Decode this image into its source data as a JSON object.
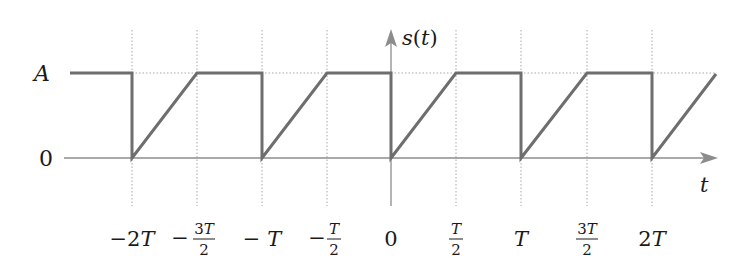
{
  "figure": {
    "y_axis_label": "s(t)",
    "x_axis_label": "t",
    "y_ticks": [
      {
        "label": "A",
        "value": "A"
      },
      {
        "label": "0",
        "value": "0"
      }
    ],
    "x_ticks": [
      {
        "label": "−2T",
        "kind": "plain",
        "value": -2.0
      },
      {
        "label": "−3T/2",
        "kind": "frac",
        "sign": "−",
        "num": "3T",
        "den": "2",
        "value": -1.5
      },
      {
        "label": "−T",
        "kind": "plain",
        "value": -1.0
      },
      {
        "label": "−T/2",
        "kind": "frac",
        "sign": "−",
        "num": "T",
        "den": "2",
        "value": -0.5
      },
      {
        "label": "0",
        "kind": "plain",
        "value": 0.0
      },
      {
        "label": "T/2",
        "kind": "frac",
        "sign": "",
        "num": "T",
        "den": "2",
        "value": 0.5
      },
      {
        "label": "T",
        "kind": "plain",
        "value": 1.0
      },
      {
        "label": "3T/2",
        "kind": "frac",
        "sign": "",
        "num": "3T",
        "den": "2",
        "value": 1.5
      },
      {
        "label": "2T",
        "kind": "plain",
        "value": 2.0
      }
    ],
    "colors": {
      "signal": "#6e6e6e",
      "axis": "#8c8c8c",
      "grid_dotted": "#a8a8a8",
      "text": "#1a1a1a"
    },
    "signal_description": "Periodic with period T: at t = kT the signal drops from A to 0, then rises linearly to A at t = kT + T/2, and holds A until t = (k+1)T.",
    "signal_points_t_over_T": [
      [
        -2.9,
        "A"
      ],
      [
        -2.0,
        "A"
      ],
      [
        -2.0,
        "0"
      ],
      [
        -1.5,
        "A"
      ],
      [
        -1.0,
        "A"
      ],
      [
        -1.0,
        "0"
      ],
      [
        -0.5,
        "A"
      ],
      [
        0.0,
        "A"
      ],
      [
        0.0,
        "0"
      ],
      [
        0.5,
        "A"
      ],
      [
        1.0,
        "A"
      ],
      [
        1.0,
        "0"
      ],
      [
        1.5,
        "A"
      ],
      [
        2.0,
        "A"
      ],
      [
        2.0,
        "0"
      ],
      [
        2.5,
        "A"
      ]
    ]
  }
}
